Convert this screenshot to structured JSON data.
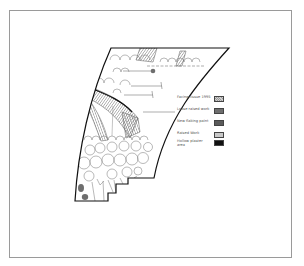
{
  "figure": {
    "type": "damage-mapping-diagram"
  },
  "legend": {
    "items": [
      {
        "label": "Facing tissue 1995",
        "color": "#a9a9a9",
        "pattern": "hatched"
      },
      {
        "label": "Loose raised work",
        "color": "#6e6e6e",
        "pattern": "solid"
      },
      {
        "label": "New  flaking paint",
        "color": "#5a5a5a",
        "pattern": "solid"
      },
      {
        "label": "Raised Work",
        "color": "#c9c9c9",
        "pattern": "solid"
      },
      {
        "label": "Hollow plaster area",
        "color": "#111111",
        "pattern": "solid"
      }
    ]
  },
  "colors": {
    "frame": "#9a9a9a",
    "outline": "#111111",
    "sketch": "#8a8a8a",
    "hatch": "#7a7a7a",
    "hollow": "#111111",
    "loose": "#6e6e6e"
  }
}
